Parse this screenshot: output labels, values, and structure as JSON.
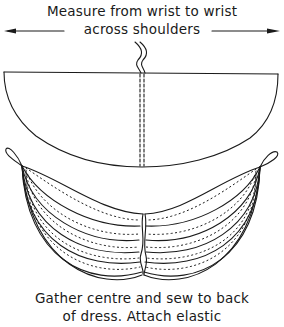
{
  "diagram": {
    "top_label": {
      "line1": "Measure from wrist to wrist",
      "line2": "across shoulders"
    },
    "bottom_label": {
      "line1": "Gather centre and sew to back",
      "line2": "of dress. Attach elastic"
    },
    "elements": [
      {
        "id": "measure-arrow",
        "type": "double-arrow",
        "label": "wrist to wrist"
      },
      {
        "id": "fabric-semicircle",
        "type": "shape",
        "label": "fabric piece (flat)"
      },
      {
        "id": "centre-fold",
        "type": "dashed-line",
        "label": "centre seam"
      },
      {
        "id": "gathered-drape",
        "type": "shape",
        "label": "gathered drape"
      },
      {
        "id": "elastic-loop-left",
        "type": "loop",
        "label": "elastic loop"
      },
      {
        "id": "elastic-loop-right",
        "type": "loop",
        "label": "elastic loop"
      }
    ],
    "colors": {
      "ink": "#1a1a1a",
      "background": "#ffffff"
    }
  }
}
